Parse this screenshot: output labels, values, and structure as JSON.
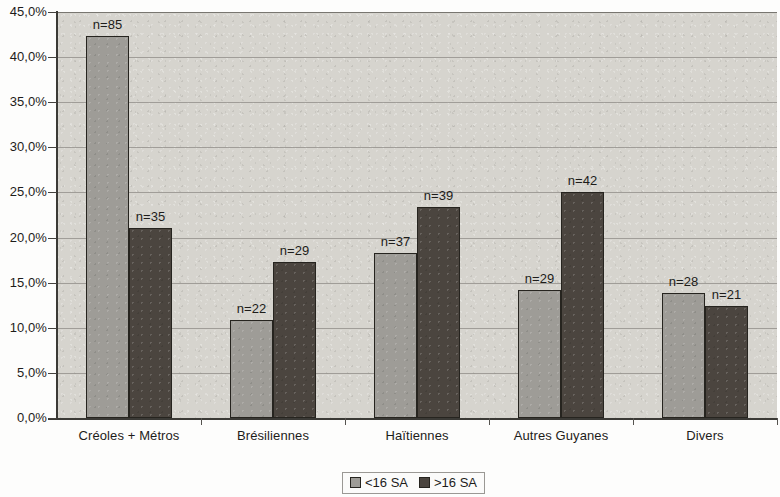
{
  "chart_data": {
    "type": "bar",
    "title": "",
    "xlabel": "",
    "ylabel": "",
    "ylim": [
      0,
      45
    ],
    "y_tick_step": 5,
    "y_tick_labels": [
      "45,0%",
      "40,0%",
      "35,0%",
      "30,0%",
      "25,0%",
      "20,0%",
      "15,0%",
      "10,0%",
      "5,0%",
      "0,0%"
    ],
    "grid": true,
    "legend_position": "bottom-center",
    "value_format": "percent",
    "decimal_separator": ",",
    "categories": [
      "Créoles + Métros",
      "Brésiliennes",
      "Haïtiennes",
      "Autres Guyanes",
      "Divers"
    ],
    "series": [
      {
        "name": "<16 SA",
        "color": "#9e9c97",
        "values": [
          42.3,
          10.9,
          18.3,
          14.2,
          13.9
        ],
        "point_labels": [
          "n=85",
          "n=22",
          "n=37",
          "n=29",
          "n=28"
        ],
        "counts": [
          85,
          22,
          37,
          29,
          28
        ]
      },
      {
        "name": ">16 SA",
        "color": "#4b453f",
        "values": [
          21.1,
          17.3,
          23.4,
          25.1,
          12.4
        ],
        "point_labels": [
          "n=35",
          "n=29",
          "n=39",
          "n=42",
          "n=21"
        ],
        "counts": [
          35,
          29,
          39,
          42,
          21
        ]
      }
    ]
  },
  "legend": {
    "items": [
      {
        "label": "<16 SA",
        "swatch": "light"
      },
      {
        "label": ">16 SA",
        "swatch": "dark"
      }
    ]
  },
  "colors": {
    "series_light": "#9e9c97",
    "series_dark": "#4b453f",
    "plot_background": "#d6d4ce",
    "page_background": "#fdfdfc",
    "gridline": "#8d8b85",
    "axis": "#3b3a36",
    "text": "#1d1c1a"
  }
}
